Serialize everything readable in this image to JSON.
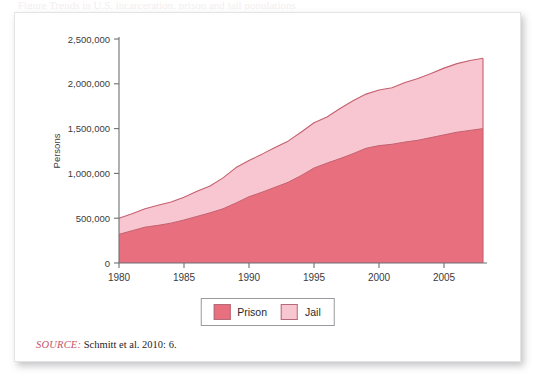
{
  "figure": {
    "title_sliver": "Figure   Trends in U.S. incarceration, prison and jail populations",
    "source_tag": "SOURCE:",
    "source_text": "Schmitt et al. 2010: 6."
  },
  "legend": {
    "position": "bottom-center",
    "items": [
      {
        "label": "Prison",
        "color": "#e8707e"
      },
      {
        "label": "Jail",
        "color": "#f8c6d0"
      }
    ]
  },
  "colors": {
    "prison": "#e8707e",
    "jail": "#f8c6d0",
    "line": "#c4606f",
    "axis": "#6f6f74",
    "text": "#3b3b3e",
    "source_accent": "#c4556b",
    "card": "#ffffff"
  },
  "chart_data": {
    "type": "area",
    "stacked": true,
    "title": "",
    "subtitle": "",
    "xlabel": "",
    "ylabel": "Persons",
    "xlim": [
      1980,
      2008
    ],
    "ylim": [
      0,
      2500000
    ],
    "grid": false,
    "legend_position": "bottom-center",
    "x": [
      1980,
      1981,
      1982,
      1983,
      1984,
      1985,
      1986,
      1987,
      1988,
      1989,
      1990,
      1991,
      1992,
      1993,
      1994,
      1995,
      1996,
      1997,
      1998,
      1999,
      2000,
      2001,
      2002,
      2003,
      2004,
      2005,
      2006,
      2007,
      2008
    ],
    "x_tick_labels": [
      "1980",
      "1985",
      "1990",
      "1995",
      "2000",
      "2005"
    ],
    "x_ticks": [
      1980,
      1985,
      1990,
      1995,
      2000,
      2005
    ],
    "y_tick_labels": [
      "0",
      "500,000",
      "1,000,000",
      "1,500,000",
      "2,000,000",
      "2,500,000"
    ],
    "y_ticks": [
      0,
      500000,
      1000000,
      1500000,
      2000000,
      2500000
    ],
    "series": [
      {
        "name": "Prison",
        "color": "#e8707e",
        "values": [
          320000,
          360000,
          400000,
          420000,
          445000,
          480000,
          520000,
          560000,
          605000,
          670000,
          740000,
          790000,
          845000,
          900000,
          975000,
          1060000,
          1115000,
          1165000,
          1220000,
          1280000,
          1310000,
          1325000,
          1350000,
          1370000,
          1400000,
          1430000,
          1460000,
          1480000,
          1500000
        ]
      },
      {
        "name": "Jail",
        "color": "#f8c6d0",
        "values": [
          180000,
          190000,
          205000,
          225000,
          235000,
          255000,
          280000,
          300000,
          345000,
          395000,
          405000,
          425000,
          445000,
          460000,
          485000,
          505000,
          515000,
          560000,
          590000,
          605000,
          620000,
          630000,
          665000,
          690000,
          715000,
          745000,
          765000,
          780000,
          785000
        ]
      }
    ],
    "totals": [
      500000,
      550000,
      605000,
      645000,
      680000,
      735000,
      800000,
      860000,
      950000,
      1065000,
      1145000,
      1215000,
      1290000,
      1360000,
      1460000,
      1565000,
      1630000,
      1725000,
      1810000,
      1885000,
      1930000,
      1955000,
      2015000,
      2060000,
      2115000,
      2175000,
      2225000,
      2260000,
      2285000
    ]
  }
}
